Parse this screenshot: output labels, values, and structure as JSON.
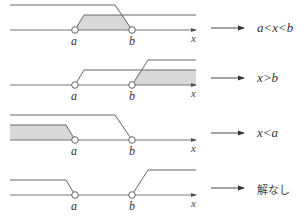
{
  "diagram": {
    "axis_label": "x",
    "point_labels": {
      "a": "a",
      "b": "b"
    },
    "shade_color": "#d8d8d8",
    "line_color": "#666666",
    "panels": [
      {
        "id": "both-between",
        "result": "a<x<b",
        "result_italic": true
      },
      {
        "id": "greater-than-b",
        "result": "x>b",
        "result_italic": true
      },
      {
        "id": "less-than-a",
        "result": "x<a",
        "result_italic": true
      },
      {
        "id": "no-solution",
        "result": "解なし",
        "result_italic": false
      }
    ]
  }
}
